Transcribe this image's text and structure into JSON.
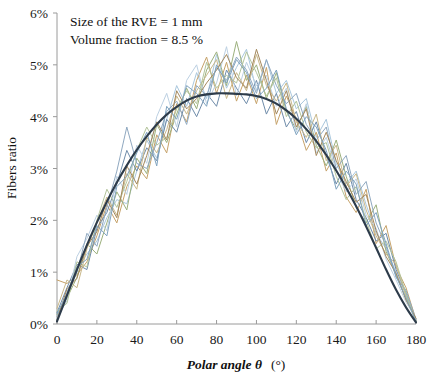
{
  "figure": {
    "width": 435,
    "height": 377,
    "background": "#ffffff"
  },
  "annotations": {
    "line1": "Size of the RVE = 1 mm",
    "line2": "Volume fraction = 8.5 %"
  },
  "axes": {
    "x_title_italic": "Polar angle θ",
    "x_title_unit": "(°)",
    "y_title": "Fibers ratio"
  },
  "chart_data": {
    "type": "line",
    "title": "",
    "subtitle": "",
    "xlabel": "Polar angle θ (°)",
    "ylabel": "Fibers ratio",
    "xlim": [
      0,
      180
    ],
    "ylim": [
      0,
      6
    ],
    "xticks": [
      0,
      20,
      40,
      60,
      80,
      100,
      120,
      140,
      160,
      180
    ],
    "yticks": [
      0,
      1,
      2,
      3,
      4,
      5,
      6
    ],
    "ytick_labels": [
      "0%",
      "1%",
      "2%",
      "3%",
      "4%",
      "5%",
      "6%"
    ],
    "xtick_labels": [
      "0",
      "20",
      "40",
      "60",
      "80",
      "100",
      "120",
      "140",
      "160",
      "180"
    ],
    "y_unit": "%",
    "grid": false,
    "legend": "none",
    "annotations": [
      "Size of the RVE = 1 mm",
      "Volume fraction = 8.5 %"
    ],
    "x": [
      0,
      5,
      10,
      15,
      20,
      25,
      30,
      35,
      40,
      45,
      50,
      55,
      60,
      65,
      70,
      75,
      80,
      85,
      90,
      95,
      100,
      105,
      110,
      115,
      120,
      125,
      130,
      135,
      140,
      145,
      150,
      155,
      160,
      165,
      170,
      175,
      180
    ],
    "series": [
      {
        "name": "realization-1",
        "color": "#a9c7dd",
        "kind": "jagged",
        "values": [
          0.1,
          0.62,
          1.05,
          1.35,
          1.6,
          2.05,
          2.4,
          2.32,
          2.95,
          3.55,
          3.2,
          3.95,
          4.6,
          4.2,
          4.85,
          4.35,
          5.2,
          4.55,
          4.95,
          5.3,
          4.5,
          5.1,
          4.45,
          4.7,
          4.15,
          4.35,
          3.6,
          3.95,
          3.1,
          2.7,
          2.95,
          2.3,
          1.75,
          1.45,
          1.0,
          0.55,
          0.05
        ]
      },
      {
        "name": "realization-2",
        "color": "#c6a269",
        "kind": "jagged",
        "values": [
          0.85,
          0.78,
          0.95,
          1.2,
          1.7,
          2.3,
          1.95,
          2.65,
          3.05,
          2.8,
          3.65,
          3.3,
          4.25,
          3.9,
          4.7,
          5.15,
          4.45,
          5.05,
          4.3,
          4.8,
          4.25,
          4.95,
          3.85,
          4.4,
          3.95,
          3.35,
          3.7,
          2.95,
          3.3,
          2.45,
          2.15,
          2.6,
          1.55,
          1.9,
          1.1,
          0.7,
          0.08
        ]
      },
      {
        "name": "realization-3",
        "color": "#9cb07d",
        "kind": "jagged",
        "values": [
          0.18,
          0.5,
          0.9,
          1.55,
          1.35,
          1.95,
          2.55,
          2.2,
          3.2,
          2.9,
          3.85,
          3.5,
          4.05,
          4.55,
          4.15,
          4.9,
          5.25,
          4.6,
          5.45,
          4.7,
          5.0,
          4.35,
          4.85,
          4.1,
          3.75,
          4.2,
          3.45,
          3.05,
          3.55,
          2.85,
          2.25,
          1.95,
          2.3,
          1.4,
          0.95,
          0.48,
          0.06
        ]
      },
      {
        "name": "realization-4",
        "color": "#6e8ba9",
        "kind": "jagged",
        "values": [
          0.22,
          0.7,
          1.15,
          1.05,
          1.85,
          2.15,
          2.7,
          3.35,
          2.95,
          3.4,
          3.15,
          3.95,
          3.7,
          4.35,
          4.0,
          4.45,
          4.2,
          4.9,
          4.55,
          4.25,
          4.7,
          4.05,
          4.45,
          3.8,
          4.1,
          3.5,
          3.9,
          3.25,
          2.7,
          3.1,
          2.4,
          2.05,
          1.6,
          1.75,
          1.05,
          0.6,
          0.04
        ]
      },
      {
        "name": "realization-5",
        "color": "#bcd0e2",
        "kind": "jagged",
        "values": [
          0.12,
          0.45,
          1.3,
          1.65,
          2.1,
          1.8,
          2.85,
          2.5,
          3.45,
          3.1,
          4.0,
          4.45,
          3.8,
          4.7,
          5.0,
          4.25,
          4.65,
          5.35,
          4.4,
          5.05,
          4.6,
          4.8,
          4.2,
          4.55,
          3.7,
          4.25,
          3.3,
          3.6,
          2.95,
          2.55,
          2.8,
          2.1,
          1.85,
          1.25,
          0.85,
          0.42,
          0.1
        ]
      },
      {
        "name": "realization-6",
        "color": "#c9b88a",
        "kind": "jagged",
        "values": [
          0.3,
          0.85,
          0.7,
          1.45,
          1.95,
          2.45,
          2.1,
          2.9,
          2.6,
          3.6,
          3.3,
          3.75,
          4.4,
          4.05,
          4.5,
          4.8,
          5.1,
          4.35,
          4.85,
          4.5,
          5.2,
          4.6,
          4.3,
          4.65,
          3.9,
          3.6,
          4.05,
          3.15,
          3.45,
          2.65,
          2.9,
          2.2,
          1.7,
          1.35,
          1.15,
          0.52,
          0.07
        ]
      },
      {
        "name": "realization-7",
        "color": "#8fa8c0",
        "kind": "jagged",
        "values": [
          0.15,
          0.55,
          1.0,
          1.75,
          1.5,
          2.25,
          2.95,
          3.8,
          3.1,
          3.0,
          3.5,
          4.1,
          4.3,
          3.85,
          4.6,
          4.4,
          4.95,
          4.7,
          5.15,
          4.9,
          4.45,
          5.1,
          4.6,
          4.25,
          4.45,
          3.85,
          3.55,
          3.8,
          3.0,
          3.25,
          2.5,
          2.75,
          1.95,
          1.5,
          0.9,
          0.65,
          0.09
        ]
      },
      {
        "name": "realization-8",
        "color": "#b3c49b",
        "kind": "jagged",
        "values": [
          0.25,
          0.4,
          1.2,
          1.1,
          2.0,
          2.6,
          2.25,
          2.75,
          3.35,
          3.8,
          3.45,
          3.6,
          4.15,
          4.5,
          4.25,
          5.05,
          4.55,
          4.8,
          4.65,
          5.25,
          4.85,
          4.4,
          4.75,
          4.0,
          4.3,
          3.7,
          3.4,
          3.5,
          2.85,
          2.4,
          2.65,
          2.0,
          1.45,
          1.6,
          1.2,
          0.58,
          0.05
        ]
      },
      {
        "name": "realization-9",
        "color": "#a3875c",
        "kind": "jagged",
        "values": [
          0.08,
          0.68,
          0.88,
          1.5,
          1.78,
          2.4,
          2.05,
          3.05,
          2.7,
          3.25,
          3.9,
          3.55,
          4.5,
          4.15,
          4.35,
          4.65,
          4.9,
          5.2,
          4.75,
          4.55,
          5.3,
          4.7,
          4.05,
          4.5,
          3.8,
          4.15,
          3.25,
          3.7,
          3.15,
          2.75,
          2.35,
          2.5,
          1.8,
          1.3,
          0.98,
          0.46,
          0.11
        ]
      },
      {
        "name": "realization-10",
        "color": "#7fa3bf",
        "kind": "jagged",
        "values": [
          0.2,
          0.58,
          1.1,
          1.25,
          1.9,
          1.7,
          2.65,
          2.85,
          3.3,
          3.7,
          3.05,
          4.2,
          3.95,
          4.6,
          4.45,
          4.2,
          5.0,
          4.65,
          5.1,
          4.85,
          4.35,
          4.55,
          4.9,
          4.15,
          3.65,
          4.0,
          3.8,
          3.35,
          2.6,
          2.95,
          2.7,
          1.9,
          2.15,
          1.55,
          0.92,
          0.5,
          0.06
        ]
      }
    ],
    "trend": {
      "name": "mean-trend",
      "color": "#2d3b4a",
      "kind": "smooth",
      "peak_value": 4.45,
      "peak_x": 90,
      "values": [
        0.05,
        0.55,
        1.05,
        1.52,
        1.96,
        2.36,
        2.73,
        3.06,
        3.36,
        3.62,
        3.85,
        4.04,
        4.19,
        4.31,
        4.39,
        4.43,
        4.45,
        4.45,
        4.44,
        4.43,
        4.4,
        4.34,
        4.25,
        4.12,
        3.96,
        3.76,
        3.53,
        3.26,
        2.96,
        2.63,
        2.27,
        1.88,
        1.47,
        1.05,
        0.66,
        0.32,
        0.03
      ]
    }
  }
}
